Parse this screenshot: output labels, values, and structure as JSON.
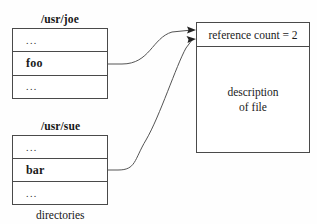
{
  "diagram": {
    "caption": "directories",
    "directories": [
      {
        "label": "/usr/joe",
        "rows": [
          {
            "text": "...",
            "kind": "ellipsis"
          },
          {
            "text": "foo",
            "kind": "named"
          },
          {
            "text": "...",
            "kind": "ellipsis"
          }
        ]
      },
      {
        "label": "/usr/sue",
        "rows": [
          {
            "text": "...",
            "kind": "ellipsis"
          },
          {
            "text": "bar",
            "kind": "named"
          },
          {
            "text": "...",
            "kind": "ellipsis"
          }
        ]
      }
    ],
    "file_block": {
      "reference_count_label": "reference count = 2",
      "reference_count_value": 2,
      "description_line1": "description",
      "description_line2": "of file"
    },
    "colors": {
      "stroke": "#4a4a4a",
      "connector": "#545454",
      "arrowhead": "#222222",
      "text": "#1a1a1a",
      "background": "#fefefe"
    }
  }
}
